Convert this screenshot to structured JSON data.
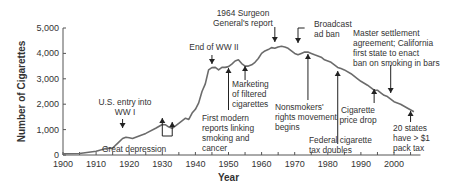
{
  "chart_data": {
    "type": "line",
    "title": "",
    "xlabel": "Year",
    "ylabel": "Number of Cigarettes",
    "xlim": [
      1900,
      2008
    ],
    "ylim": [
      0,
      5000
    ],
    "grid": false,
    "x_ticks": [
      "1900",
      "1910",
      "1920",
      "1930",
      "1940",
      "1950",
      "1960",
      "1970",
      "1980",
      "1990",
      "2000"
    ],
    "y_ticks": [
      "0",
      "1,000",
      "2,000",
      "3,000",
      "4,000",
      "5,000"
    ],
    "series": [
      {
        "name": "Per capita cigarette consumption",
        "x": [
          1900,
          1905,
          1910,
          1913,
          1915,
          1916,
          1918,
          1919,
          1920,
          1921,
          1923,
          1925,
          1928,
          1930,
          1931,
          1932,
          1933,
          1935,
          1937,
          1938,
          1939,
          1940,
          1941,
          1942,
          1943,
          1944,
          1945,
          1946,
          1947,
          1948,
          1949,
          1950,
          1951,
          1952,
          1953,
          1954,
          1955,
          1956,
          1957,
          1958,
          1959,
          1960,
          1961,
          1962,
          1963,
          1964,
          1965,
          1966,
          1967,
          1968,
          1969,
          1970,
          1971,
          1972,
          1973,
          1974,
          1975,
          1976,
          1977,
          1978,
          1979,
          1980,
          1981,
          1982,
          1983,
          1984,
          1985,
          1987,
          1989,
          1990,
          1992,
          1994,
          1995,
          1996,
          1997,
          1998,
          1999,
          2000,
          2002,
          2004,
          2006
        ],
        "values": [
          50,
          60,
          150,
          260,
          270,
          400,
          650,
          700,
          680,
          650,
          750,
          850,
          1050,
          1200,
          1190,
          1100,
          1050,
          1250,
          1450,
          1400,
          1650,
          1800,
          2050,
          2500,
          2800,
          3350,
          3440,
          3450,
          3350,
          3450,
          3450,
          3480,
          3580,
          3700,
          3750,
          3600,
          3500,
          3500,
          3550,
          3650,
          3800,
          4000,
          4100,
          4150,
          4230,
          4200,
          4250,
          4280,
          4250,
          4200,
          4100,
          4000,
          3950,
          4000,
          4050,
          4050,
          4000,
          3950,
          3900,
          3850,
          3750,
          3700,
          3650,
          3550,
          3450,
          3400,
          3350,
          3200,
          3000,
          2900,
          2750,
          2550,
          2550,
          2450,
          2350,
          2300,
          2200,
          2100,
          2000,
          1850,
          1700
        ]
      }
    ],
    "annotations": [
      {
        "text": "U.S. entry into WW I",
        "year": 1918,
        "arrow": "down"
      },
      {
        "text": "Great depression",
        "year": 1930,
        "arrow": "up",
        "second_year": 1933
      },
      {
        "text": "End of WW II",
        "year": 1945,
        "arrow": "down"
      },
      {
        "text": "First modern reports linking smoking and cancer",
        "year": 1950,
        "arrow": "up"
      },
      {
        "text": "Marketing of filtered cigarettes",
        "year": 1955,
        "arrow": "up"
      },
      {
        "text": "1964 Surgeon General's report",
        "year": 1964,
        "arrow": "down"
      },
      {
        "text": "Broadcast ad ban",
        "year": 1971,
        "arrow": "down"
      },
      {
        "text": "Nonsmokers' rights movement begins",
        "year": 1974,
        "arrow": "up"
      },
      {
        "text": "Federal cigarette tax doubles",
        "year": 1983,
        "arrow": "up"
      },
      {
        "text": "Cigarette price drop",
        "year": 1994,
        "arrow": "up"
      },
      {
        "text": "Master settlement agreement; California first state to enact ban on smoking in bars",
        "year": 1999,
        "arrow": "down"
      },
      {
        "text": "20 states have > $1 pack tax",
        "year": 2005,
        "arrow": "up"
      }
    ]
  },
  "axis": {
    "xlabel": "Year",
    "ylabel": "Number of Cigarettes",
    "x_ticks": [
      "1900",
      "1910",
      "1920",
      "1930",
      "1940",
      "1950",
      "1960",
      "1970",
      "1980",
      "1990",
      "2000"
    ],
    "y_ticks": [
      "0",
      "1,000",
      "2,000",
      "3,000",
      "4,000",
      "5,000"
    ]
  },
  "annotations": {
    "wwi": [
      "U.S. entry into",
      "WW I"
    ],
    "depression": [
      "Great depression"
    ],
    "wwii": [
      "End of WW II"
    ],
    "reports": [
      "First modern",
      "reports linking",
      "smoking and",
      "cancer"
    ],
    "filtered": [
      "Marketing",
      "of filtered",
      "cigarettes"
    ],
    "surgeon": [
      "1964 Surgeon",
      "General's report"
    ],
    "broadcast": [
      "Broadcast",
      "ad ban"
    ],
    "nonsmokers": [
      "Nonsmokers'",
      "rights movement",
      "begins"
    ],
    "fedtax": [
      "Federal cigarette",
      "tax doubles"
    ],
    "pricedrop": [
      "Cigarette",
      "price drop"
    ],
    "msa": [
      "Master settlement",
      "agreement; California",
      "first state to enact",
      "ban on smoking in bars"
    ],
    "states": [
      "20 states",
      "have > $1",
      "pack tax"
    ]
  },
  "colors": {
    "line": "#6b6b6b",
    "axis": "#555555",
    "text": "#333333",
    "arrow": "#222222"
  }
}
